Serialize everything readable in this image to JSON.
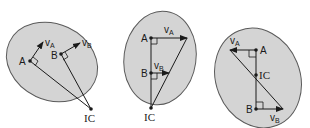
{
  "colors": {
    "body_fill": "#d4d4d4",
    "body_stroke": "#5a5a5a",
    "line": "#1a1a1a",
    "background": "#ffffff"
  },
  "panels": [
    {
      "id": "panel-1",
      "point_a": "A",
      "point_b": "B",
      "velocity_a": "v",
      "velocity_a_sub": "A",
      "velocity_b": "v",
      "velocity_b_sub": "B",
      "ic": "IC"
    },
    {
      "id": "panel-2",
      "point_a": "A",
      "point_b": "B",
      "velocity_a": "v",
      "velocity_a_sub": "A",
      "velocity_b": "v",
      "velocity_b_sub": "B",
      "ic": "IC"
    },
    {
      "id": "panel-3",
      "point_a": "A",
      "point_b": "B",
      "velocity_a": "v",
      "velocity_a_sub": "A",
      "velocity_b": "v",
      "velocity_b_sub": "B",
      "ic": "IC"
    }
  ]
}
